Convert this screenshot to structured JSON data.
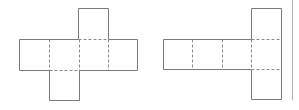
{
  "diagram": {
    "title": "",
    "figures": [
      {
        "name": "cube-net-cross",
        "description": "Net of a cube: four squares in a row, one square above the third, one square below the second",
        "cells": [
          [
            0,
            1
          ],
          [
            1,
            1
          ],
          [
            2,
            1
          ],
          [
            3,
            1
          ],
          [
            2,
            0
          ],
          [
            1,
            2
          ]
        ],
        "fold_lines": "dashed",
        "cut_lines": "solid"
      },
      {
        "name": "cube-net-t",
        "description": "Four squares in a row with a vertical column of three squares at the right end",
        "cells": [
          [
            0,
            1
          ],
          [
            1,
            1
          ],
          [
            2,
            1
          ],
          [
            3,
            1
          ],
          [
            3,
            0
          ],
          [
            3,
            2
          ]
        ],
        "fold_lines": "dashed",
        "cut_lines": "solid"
      }
    ],
    "colors": {
      "line": "#7a7a7a",
      "divider": "#b0b0b0",
      "background": "#ffffff"
    }
  }
}
